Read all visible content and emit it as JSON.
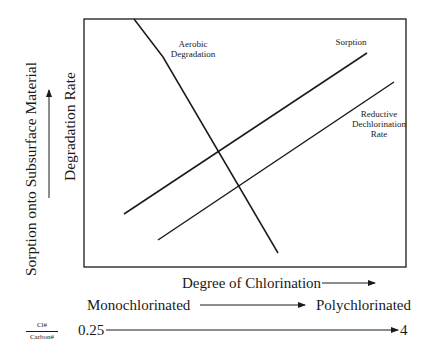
{
  "diagram": {
    "y_axis": {
      "outer_label": "Sorption onto Subsurface Material",
      "inner_label": "Degradation Rate"
    },
    "x_axis": {
      "label": "Degree of Chlorination",
      "range_start_label": "Monochlorinated",
      "range_end_label": "Polychlorinated",
      "ratio_numerator": "Cl#",
      "ratio_denominator": "Carbon#",
      "ratio_min": "0.25",
      "ratio_max": "4"
    },
    "curves": [
      {
        "name": "Aerobic Degradation",
        "label_line1": "Aerobic",
        "label_line2": "Degradation",
        "trend": "decreasing"
      },
      {
        "name": "Sorption",
        "label_line1": "Sorption",
        "trend": "increasing"
      },
      {
        "name": "Reductive Dechlorination Rate",
        "label_line1": "Reductive",
        "label_line2": "Dechlorination",
        "label_line3": "Rate",
        "trend": "increasing"
      }
    ],
    "colors": {
      "line": "#1a1a1a",
      "background": "#ffffff"
    }
  }
}
